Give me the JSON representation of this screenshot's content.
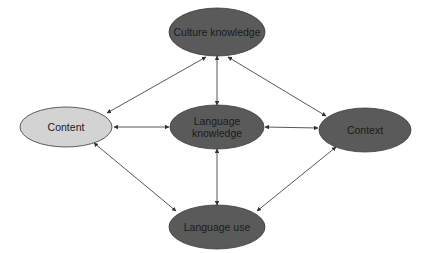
{
  "diagram": {
    "colors": {
      "dark_node_fill": "#5a5a5a",
      "light_node_fill": "#d3d3d3",
      "node_stroke": "#3a3a3a",
      "edge": "#444444",
      "text": "#1a1a1a"
    },
    "nodes": [
      {
        "id": "culture-knowledge",
        "label": "Culture knowledge",
        "lines": [
          "Culture knowledge"
        ],
        "cx": 217,
        "cy": 32,
        "rx": 48,
        "ry": 24,
        "style": "dark"
      },
      {
        "id": "content",
        "label": "Content",
        "lines": [
          "Content"
        ],
        "cx": 66,
        "cy": 127,
        "rx": 46,
        "ry": 20,
        "style": "light"
      },
      {
        "id": "language-knowledge",
        "label": "Language knowledge",
        "lines": [
          "Language",
          "knowledge"
        ],
        "cx": 217,
        "cy": 127,
        "rx": 47,
        "ry": 22,
        "style": "dark"
      },
      {
        "id": "context",
        "label": "Context",
        "lines": [
          "Context"
        ],
        "cx": 365,
        "cy": 130,
        "rx": 46,
        "ry": 22,
        "style": "dark"
      },
      {
        "id": "language-use",
        "label": "Language use",
        "lines": [
          "Language use"
        ],
        "cx": 217,
        "cy": 227,
        "rx": 48,
        "ry": 22,
        "style": "dark"
      }
    ],
    "edges": [
      {
        "from": "culture-knowledge",
        "to": "content",
        "x1": 206,
        "y1": 57,
        "x2": 107,
        "y2": 113,
        "bidirectional": true
      },
      {
        "from": "culture-knowledge",
        "to": "language-knowledge",
        "x1": 217,
        "y1": 56,
        "x2": 217,
        "y2": 105,
        "bidirectional": true
      },
      {
        "from": "culture-knowledge",
        "to": "context",
        "x1": 228,
        "y1": 57,
        "x2": 326,
        "y2": 116,
        "bidirectional": true
      },
      {
        "from": "content",
        "to": "language-knowledge",
        "x1": 114,
        "y1": 127,
        "x2": 169,
        "y2": 127,
        "bidirectional": true
      },
      {
        "from": "language-knowledge",
        "to": "context",
        "x1": 265,
        "y1": 127,
        "x2": 318,
        "y2": 128,
        "bidirectional": true
      },
      {
        "from": "content",
        "to": "language-use",
        "x1": 94,
        "y1": 143,
        "x2": 176,
        "y2": 211,
        "bidirectional": true
      },
      {
        "from": "language-knowledge",
        "to": "language-use",
        "x1": 217,
        "y1": 149,
        "x2": 217,
        "y2": 205,
        "bidirectional": true
      },
      {
        "from": "context",
        "to": "language-use",
        "x1": 336,
        "y1": 147,
        "x2": 257,
        "y2": 211,
        "bidirectional": true
      }
    ]
  }
}
